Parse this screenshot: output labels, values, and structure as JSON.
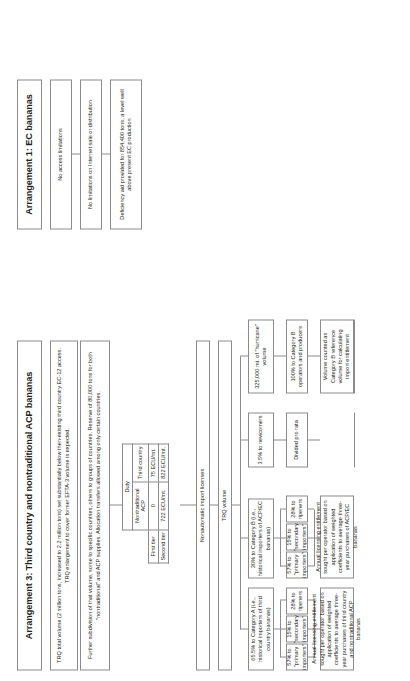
{
  "document": {
    "orientation": "rotated-90-ccw"
  },
  "arrangement3": {
    "title": "Arrangement 3: Third country and nontraditional ACP bananas",
    "paragraph1": "TRQ total volume (2 million tons, increased to 2.2 million tons) set substantially below then-existing third country EC-12 access. TRQ enlargement to cover former EFTA-3 volume is expected.",
    "paragraph2": "Further subdivision of that volume, some to specific countries, others to groups of countries. Reserve of 80,000 tons for both \"nontraditional\" and ACP supplies. Allocation transfers allowed among only certain countries.",
    "duty_table": {
      "caption": "Duty",
      "col_headers": [
        "Nontraditional ACP",
        "Third country"
      ],
      "rows": [
        {
          "label": "First tier",
          "cells": [
            "0",
            "75 ECU/mt."
          ]
        },
        {
          "label": "Second tier",
          "cells": [
            "722 ECU/mt.",
            "822 ECU/mt."
          ]
        }
      ]
    },
    "licenses_label": "Nonautomatic import licenses",
    "trq_volume_label": "TRQ volume",
    "branches": [
      {
        "id": "category-a",
        "share": "65.5% to Category A (i.e., historical importers of third country bananas)",
        "sub": [
          "57% to \"primary importers\"",
          "15% to \"secondary importers\"",
          "28% to ripeners"
        ],
        "note": "Annual licensing entitlement sought per operator based on application of weighted coefficients to average three-year purchases of third country and nontraditional ACP bananas"
      },
      {
        "id": "category-b",
        "share": "30% to Category B (i.e., historical importers of ACP/EC bananas)",
        "sub": [
          "57% to \"primary importers\"",
          "15% to \"secondary importers\"",
          "28% to ripeners"
        ],
        "note": "Annual licensing entitlement sought per operator based on application of weighted coefficients to average three-year purchases of ACP/EC bananas"
      },
      {
        "id": "newcomers",
        "share": "3.5% to newcomers",
        "sub": [
          "Divided pro rata"
        ],
        "note": ""
      },
      {
        "id": "hurricane",
        "share": "325,000 mt. of \"hurricane\" volume",
        "sub": [
          "100% to Category B operators and producers"
        ],
        "note": "Volume counted as Category B reference volume for calculating import entitlement"
      }
    ]
  },
  "arrangement1": {
    "title": "Arrangement 1: EC bananas",
    "items": [
      "No access limitations",
      "No limitations on Internet sale or distribution",
      "Deficiency aid provided for 854,400 tons, a level well above present EC production"
    ]
  }
}
